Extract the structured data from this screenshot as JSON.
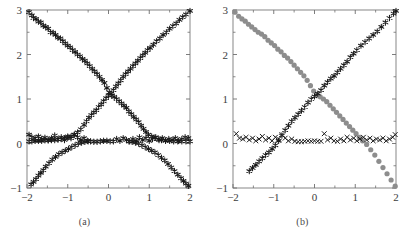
{
  "figure": {
    "panels": [
      {
        "id": "a",
        "caption": "(a)"
      },
      {
        "id": "b",
        "caption": "(b)"
      }
    ]
  },
  "axes": {
    "xlabel": "",
    "ylabel": "",
    "xlim": [
      -2,
      2
    ],
    "ylim": [
      -1,
      3
    ],
    "xticks": [
      -2,
      -1,
      0,
      1,
      2
    ],
    "xticklabels": [
      "−2",
      "−1",
      "0",
      "1",
      "2"
    ],
    "yticks": [
      -1,
      0,
      1,
      2,
      3
    ],
    "yticklabels": [
      "−1",
      "0",
      "1",
      "2",
      "3"
    ],
    "xminorticks": [
      -1.5,
      -0.5,
      0.5,
      1.5
    ],
    "yminorticks": [
      -0.5,
      0.5,
      1.5,
      2.5
    ],
    "grid": false,
    "frame_color": "#7a7a7a",
    "tick_color": "#6e6e6e",
    "label_color": "#3d3d3d",
    "background": "#ffffff"
  },
  "colors": {
    "marker_black": "#1a1a1a",
    "marker_gray": "#8d8d8d",
    "frame": "#7a7a7a"
  },
  "chart_data": [
    {
      "type": "scatter",
      "title": "(a)",
      "xlabel": "",
      "ylabel": "",
      "xlim": [
        -2,
        2
      ],
      "ylim": [
        -1,
        3
      ],
      "grid": false,
      "legend": "none",
      "series": [
        {
          "name": "descending-branch",
          "marker": "asterisk",
          "color": "#1a1a1a",
          "x": [
            -1.95,
            -1.88,
            -1.84,
            -1.78,
            -1.72,
            -1.66,
            -1.6,
            -1.54,
            -1.48,
            -1.42,
            -1.36,
            -1.3,
            -1.24,
            -1.18,
            -1.12,
            -1.06,
            -1.0,
            -0.94,
            -0.88,
            -0.82,
            -0.76,
            -0.7,
            -0.64,
            -0.58,
            -0.52,
            -0.46,
            -0.4,
            -0.34,
            -0.28,
            -0.22,
            -0.16,
            -0.1,
            -0.04,
            0.02,
            0.08,
            0.14,
            0.2,
            0.26,
            0.32,
            0.38,
            0.44,
            0.5,
            0.56,
            0.62,
            0.68,
            0.74,
            0.8,
            0.86,
            0.92,
            0.98,
            1.06,
            1.14,
            1.22,
            1.3,
            1.4,
            1.5,
            1.6,
            1.7,
            1.8,
            1.9,
            2.0
          ],
          "y": [
            2.95,
            2.88,
            2.82,
            2.8,
            2.74,
            2.72,
            2.65,
            2.62,
            2.58,
            2.5,
            2.49,
            2.44,
            2.38,
            2.36,
            2.3,
            2.25,
            2.2,
            2.16,
            2.1,
            2.06,
            2.0,
            1.96,
            1.9,
            1.86,
            1.8,
            1.74,
            1.68,
            1.62,
            1.56,
            1.5,
            1.43,
            1.36,
            1.25,
            1.15,
            1.08,
            1.05,
            1.0,
            0.95,
            0.9,
            0.85,
            0.8,
            0.72,
            0.66,
            0.6,
            0.54,
            0.48,
            0.4,
            0.33,
            0.26,
            0.2,
            0.16,
            0.13,
            0.1,
            0.08,
            0.07,
            0.06,
            0.05,
            0.05,
            0.05,
            0.05,
            0.05
          ]
        },
        {
          "name": "ascending-branch",
          "marker": "asterisk",
          "color": "#1a1a1a",
          "x": [
            -1.95,
            -1.88,
            -1.8,
            -1.72,
            -1.64,
            -1.56,
            -1.48,
            -1.4,
            -1.32,
            -1.24,
            -1.16,
            -1.08,
            -1.0,
            -0.92,
            -0.84,
            -0.76,
            -0.68,
            -0.6,
            -0.54,
            -0.48,
            -0.42,
            -0.36,
            -0.3,
            -0.24,
            -0.18,
            -0.12,
            -0.06,
            0.0,
            0.06,
            0.12,
            0.18,
            0.24,
            0.3,
            0.36,
            0.42,
            0.48,
            0.54,
            0.6,
            0.66,
            0.72,
            0.78,
            0.84,
            0.9,
            0.96,
            1.02,
            1.1,
            1.18,
            1.26,
            1.34,
            1.42,
            1.5,
            1.58,
            1.66,
            1.74,
            1.82,
            1.9,
            2.0
          ],
          "y": [
            0.05,
            0.05,
            0.06,
            0.06,
            0.06,
            0.07,
            0.07,
            0.08,
            0.08,
            0.09,
            0.1,
            0.12,
            0.13,
            0.16,
            0.2,
            0.25,
            0.32,
            0.42,
            0.5,
            0.58,
            0.64,
            0.7,
            0.75,
            0.82,
            0.88,
            0.95,
            1.02,
            1.08,
            1.12,
            1.2,
            1.28,
            1.35,
            1.42,
            1.5,
            1.56,
            1.62,
            1.68,
            1.74,
            1.8,
            1.86,
            1.92,
            1.98,
            2.04,
            2.1,
            2.15,
            2.22,
            2.3,
            2.36,
            2.44,
            2.5,
            2.58,
            2.64,
            2.7,
            2.78,
            2.84,
            2.9,
            2.98
          ]
        },
        {
          "name": "flat-branch",
          "marker": "asterisk",
          "color": "#1a1a1a",
          "x": [
            -1.95,
            -1.88,
            -1.8,
            -1.72,
            -1.64,
            -1.56,
            -1.48,
            -1.4,
            -1.32,
            -1.24,
            -1.16,
            -1.08,
            -1.0,
            -0.92,
            -0.84,
            -0.76,
            -0.68,
            -0.6,
            -0.52,
            -0.44,
            -0.36,
            -0.28,
            -0.2,
            -0.12,
            -0.04,
            0.04,
            0.12,
            0.2,
            0.28,
            0.36,
            0.44,
            0.52,
            0.6,
            0.68,
            0.76,
            0.84,
            0.92,
            1.0,
            1.08,
            1.16,
            1.24,
            1.32,
            1.4,
            1.48,
            1.56,
            1.64,
            1.72,
            1.8,
            1.88,
            1.96
          ],
          "y": [
            0.2,
            0.14,
            0.12,
            0.16,
            0.1,
            0.13,
            0.08,
            0.12,
            0.18,
            0.1,
            0.14,
            0.08,
            0.16,
            0.12,
            0.2,
            0.14,
            0.08,
            0.12,
            0.06,
            0.05,
            0.04,
            0.04,
            0.05,
            0.06,
            0.06,
            0.05,
            0.05,
            0.1,
            0.06,
            0.12,
            0.08,
            0.05,
            0.1,
            0.06,
            0.14,
            0.08,
            0.12,
            0.06,
            0.1,
            0.14,
            0.08,
            0.12,
            0.06,
            0.1,
            0.08,
            0.12,
            0.06,
            0.1,
            0.14,
            0.12
          ]
        },
        {
          "name": "lower-left-branch",
          "marker": "asterisk",
          "color": "#1a1a1a",
          "x": [
            -1.9,
            -1.84,
            -1.78,
            -1.72,
            -1.66,
            -1.6,
            -1.54,
            -1.46,
            -1.38,
            -1.3,
            -1.22,
            -1.14,
            -1.06,
            -0.98,
            -0.9,
            -0.82,
            -0.74,
            -0.66,
            -0.58,
            -0.5
          ],
          "y": [
            -0.92,
            -0.86,
            -0.8,
            -0.72,
            -0.66,
            -0.6,
            -0.52,
            -0.44,
            -0.36,
            -0.3,
            -0.24,
            -0.2,
            -0.16,
            -0.12,
            -0.08,
            -0.04,
            0.0,
            0.02,
            0.04,
            0.05
          ]
        },
        {
          "name": "lower-right-branch",
          "marker": "asterisk",
          "color": "#1a1a1a",
          "x": [
            0.5,
            0.58,
            0.66,
            0.74,
            0.82,
            0.9,
            0.98,
            1.06,
            1.14,
            1.22,
            1.3,
            1.38,
            1.46,
            1.54,
            1.62,
            1.7,
            1.78,
            1.84,
            1.9,
            1.96
          ],
          "y": [
            0.05,
            0.04,
            0.02,
            0.0,
            -0.04,
            -0.08,
            -0.12,
            -0.16,
            -0.2,
            -0.26,
            -0.32,
            -0.38,
            -0.46,
            -0.54,
            -0.62,
            -0.7,
            -0.78,
            -0.84,
            -0.9,
            -0.95
          ]
        }
      ]
    },
    {
      "type": "scatter",
      "title": "(b)",
      "xlabel": "",
      "ylabel": "",
      "xlim": [
        -2,
        2
      ],
      "ylim": [
        -1,
        3
      ],
      "grid": false,
      "legend": "none",
      "series": [
        {
          "name": "descending-branch-circles",
          "marker": "circle",
          "color": "#8d8d8d",
          "x": [
            -1.95,
            -1.86,
            -1.78,
            -1.7,
            -1.62,
            -1.54,
            -1.46,
            -1.38,
            -1.3,
            -1.22,
            -1.14,
            -1.06,
            -0.98,
            -0.9,
            -0.82,
            -0.74,
            -0.66,
            -0.58,
            -0.5,
            -0.42,
            -0.34,
            -0.26,
            -0.18,
            -0.1,
            -0.02,
            0.06,
            0.14,
            0.22,
            0.3,
            0.38,
            0.46,
            0.54,
            0.62,
            0.7,
            0.78,
            0.86,
            0.94,
            1.02,
            1.1,
            1.18,
            1.28,
            1.38,
            1.48,
            1.58,
            1.68,
            1.78,
            1.88,
            1.98
          ],
          "y": [
            2.95,
            2.86,
            2.8,
            2.75,
            2.68,
            2.62,
            2.56,
            2.5,
            2.46,
            2.4,
            2.32,
            2.26,
            2.2,
            2.12,
            2.06,
            1.98,
            1.92,
            1.84,
            1.76,
            1.68,
            1.6,
            1.52,
            1.42,
            1.3,
            1.18,
            1.1,
            1.05,
            1.0,
            0.94,
            0.86,
            0.78,
            0.7,
            0.62,
            0.54,
            0.46,
            0.38,
            0.3,
            0.22,
            0.14,
            0.06,
            -0.02,
            -0.14,
            -0.26,
            -0.4,
            -0.54,
            -0.68,
            -0.82,
            -0.96
          ]
        },
        {
          "name": "ascending-branch-stars",
          "marker": "asterisk",
          "color": "#1a1a1a",
          "x": [
            -1.6,
            -1.52,
            -1.44,
            -1.36,
            -1.28,
            -1.2,
            -1.12,
            -1.04,
            -0.96,
            -0.88,
            -0.8,
            -0.72,
            -0.64,
            -0.56,
            -0.48,
            -0.4,
            -0.32,
            -0.24,
            -0.16,
            -0.08,
            0.0,
            0.08,
            0.16,
            0.24,
            0.32,
            0.4,
            0.48,
            0.56,
            0.64,
            0.72,
            0.8,
            0.88,
            0.96,
            1.04,
            1.14,
            1.24,
            1.34,
            1.44,
            1.54,
            1.64,
            1.74,
            1.84,
            1.94,
            2.0
          ],
          "y": [
            -0.62,
            -0.55,
            -0.48,
            -0.4,
            -0.33,
            -0.26,
            -0.2,
            -0.12,
            -0.04,
            0.06,
            0.18,
            0.3,
            0.4,
            0.5,
            0.58,
            0.66,
            0.74,
            0.82,
            0.92,
            1.0,
            1.06,
            1.12,
            1.2,
            1.3,
            1.38,
            1.46,
            1.52,
            1.6,
            1.68,
            1.76,
            1.84,
            1.94,
            2.02,
            2.1,
            2.2,
            2.28,
            2.36,
            2.44,
            2.52,
            2.62,
            2.72,
            2.82,
            2.92,
            2.98
          ]
        },
        {
          "name": "flat-branch-crosses",
          "marker": "cross",
          "color": "#1a1a1a",
          "x": [
            -1.92,
            -1.84,
            -1.76,
            -1.68,
            -1.6,
            -1.52,
            -1.44,
            -1.36,
            -1.28,
            -1.2,
            -1.12,
            -1.04,
            -0.96,
            -0.88,
            -0.8,
            -0.72,
            -0.64,
            -0.56,
            -0.48,
            -0.4,
            -0.32,
            -0.24,
            -0.16,
            -0.08,
            0.0,
            0.08,
            0.16,
            0.24,
            0.32,
            0.4,
            0.48,
            0.56,
            0.64,
            0.72,
            0.8,
            0.88,
            0.96,
            1.04,
            1.12,
            1.2,
            1.28,
            1.36,
            1.44,
            1.52,
            1.6,
            1.68,
            1.76,
            1.84,
            1.92,
            1.98
          ],
          "y": [
            0.22,
            0.12,
            0.1,
            0.14,
            0.08,
            0.12,
            0.06,
            0.1,
            0.16,
            0.08,
            0.12,
            0.06,
            0.14,
            0.1,
            0.2,
            0.12,
            0.06,
            0.1,
            0.05,
            0.04,
            0.04,
            0.05,
            0.06,
            0.05,
            0.06,
            0.05,
            0.05,
            0.22,
            0.08,
            0.12,
            0.06,
            0.05,
            0.1,
            0.06,
            0.14,
            0.08,
            0.12,
            0.06,
            0.1,
            0.14,
            0.08,
            0.12,
            0.06,
            0.1,
            0.08,
            0.12,
            0.06,
            0.1,
            0.14,
            0.2
          ]
        }
      ]
    }
  ]
}
